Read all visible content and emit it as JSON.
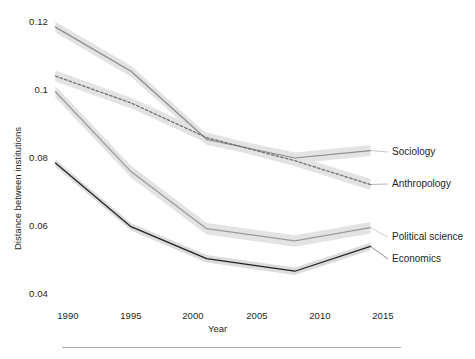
{
  "chart_data": {
    "type": "line",
    "title": "",
    "xlabel": "Year",
    "ylabel": "Distance between institutions",
    "xlim": [
      1989,
      2015
    ],
    "ylim": [
      0.04,
      0.122
    ],
    "grid": false,
    "legend_position": "right-inline",
    "xticks": [
      1990,
      1995,
      2000,
      2005,
      2010,
      2015
    ],
    "xtick_labels": [
      "1990",
      "1995",
      "2000",
      "2005",
      "2010",
      "2015"
    ],
    "yticks": [
      0.04,
      0.06,
      0.08,
      0.1,
      0.12
    ],
    "ytick_labels": [
      "0.04",
      "0.06",
      "0.08",
      "0.1",
      "0.12"
    ],
    "series": [
      {
        "name": "Sociology",
        "style": "solid",
        "color": "#8c8c8c",
        "band_color": "#e3e3e3",
        "x": [
          1989,
          1995,
          2001,
          2008,
          2014
        ],
        "values": [
          0.1185,
          0.1055,
          0.0855,
          0.08,
          0.0822
        ],
        "band_halfwidth": 0.0016
      },
      {
        "name": "Anthropology",
        "style": "dashed",
        "color": "#6f6f6f",
        "band_color": "#e3e3e3",
        "x": [
          1989,
          1995,
          2001,
          2008,
          2014
        ],
        "values": [
          0.1041,
          0.0962,
          0.086,
          0.0792,
          0.0722
        ],
        "band_halfwidth": 0.0016
      },
      {
        "name": "Political science",
        "style": "solid",
        "color": "#9a9a9a",
        "band_color": "#e3e3e3",
        "x": [
          1989,
          1995,
          2001,
          2008,
          2014
        ],
        "values": [
          0.0995,
          0.076,
          0.0592,
          0.0556,
          0.0595
        ],
        "band_halfwidth": 0.0017
      },
      {
        "name": "Economics",
        "style": "solid",
        "color": "#231f20",
        "band_color": "#dcdcdc",
        "x": [
          1989,
          1995,
          2001,
          2008,
          2014
        ],
        "values": [
          0.0785,
          0.0598,
          0.0504,
          0.0467,
          0.054
        ],
        "band_halfwidth": 0.0011
      }
    ],
    "series_labels": [
      {
        "text": "Sociology",
        "x": 392,
        "y": 146
      },
      {
        "text": "Anthropology",
        "x": 392,
        "y": 178
      },
      {
        "text": "Political science",
        "x": 392,
        "y": 231
      },
      {
        "text": "Economics",
        "x": 392,
        "y": 253
      }
    ]
  },
  "axes": {
    "x_title": "Year",
    "y_title": "Distance between institutions"
  }
}
